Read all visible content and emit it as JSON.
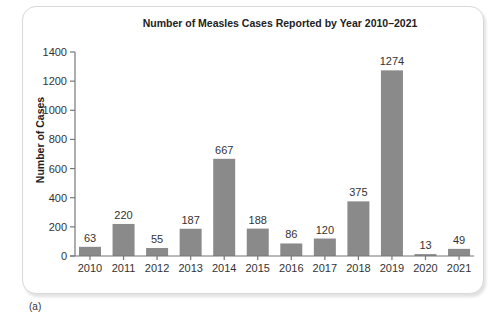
{
  "figure": {
    "title": "Number of Measles Cases Reported by Year 2010–2021",
    "ylabel": "Number of Cases",
    "caption": "(a)",
    "bar_color": "#8a8a8a",
    "axis_color": "#777777"
  },
  "chart_data": {
    "type": "bar",
    "title": "Number of Measles Cases Reported by Year 2010–2021",
    "xlabel": "",
    "ylabel": "Number of Cases",
    "categories": [
      "2010",
      "2011",
      "2012",
      "2013",
      "2014",
      "2015",
      "2016",
      "2017",
      "2018",
      "2019",
      "2020",
      "2021"
    ],
    "values": [
      63,
      220,
      55,
      187,
      667,
      188,
      86,
      120,
      375,
      1274,
      13,
      49
    ],
    "data_labels": [
      "63",
      "220",
      "55",
      "187",
      "667",
      "188",
      "86",
      "120",
      "375",
      "1274",
      "13",
      "49"
    ],
    "yticks": [
      0,
      200,
      400,
      600,
      800,
      1000,
      1200,
      1400
    ],
    "ylim": [
      0,
      1400
    ],
    "grid": false,
    "legend": null
  }
}
